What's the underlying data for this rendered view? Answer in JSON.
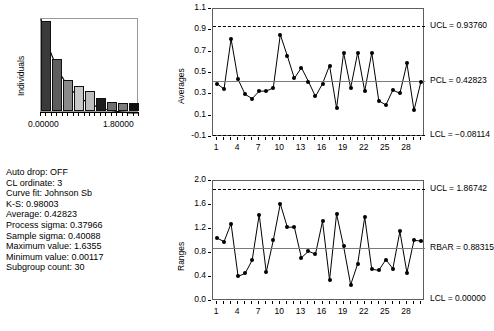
{
  "histogram": {
    "y_axis_title": "Individuals",
    "x_tick_labels": [
      "0.00000",
      "1.80000"
    ],
    "x_min": 0.0,
    "x_max": 1.8,
    "bars": [
      {
        "value": 0.96,
        "shade": "#3a3a3a"
      },
      {
        "value": 0.55,
        "shade": "#5e5e5e"
      },
      {
        "value": 0.33,
        "shade": "#8a8a8a"
      },
      {
        "value": 0.27,
        "shade": "#c8c8c8"
      },
      {
        "value": 0.21,
        "shade": "#bdbdbd"
      },
      {
        "value": 0.14,
        "shade": "#1c1c1c"
      },
      {
        "value": 0.1,
        "shade": "#6f6f6f"
      },
      {
        "value": 0.085,
        "shade": "#7d7d7d"
      },
      {
        "value": 0.09,
        "shade": "#101010"
      }
    ],
    "curve_fit_label": "Johnson Sb"
  },
  "info": {
    "lines": [
      "Auto drop: OFF",
      "CL ordinate: 3",
      "Curve fit: Johnson Sb",
      "K-S: 0.98003",
      "Average: 0.42823",
      "Process sigma: 0.37966",
      "Sample sigma: 0.40088",
      "Maximum value: 1.6355",
      "Minimum value: 0.00117",
      "Subgroup count: 30"
    ],
    "auto_drop": "OFF",
    "cl_ordinate": "3",
    "curve_fit": "Johnson Sb",
    "ks": "0.98003",
    "average": "0.42823",
    "process_sigma": "0.37966",
    "sample_sigma": "0.40088",
    "maximum_value": "1.6355",
    "minimum_value": "0.00117",
    "subgroup_count": "30"
  },
  "chart_data": [
    {
      "type": "line",
      "name": "averages-control-chart",
      "title": "",
      "ylabel": "Averages",
      "xlabel": "",
      "ylim": [
        -0.1,
        1.1
      ],
      "yticks": [
        "1.1",
        "0.9",
        "0.7",
        "0.5",
        "0.3",
        "0.1",
        "-0.1"
      ],
      "ytick_values": [
        1.1,
        0.9,
        0.7,
        0.5,
        0.3,
        0.1,
        -0.1
      ],
      "xticks": [
        "1",
        "4",
        "7",
        "10",
        "13",
        "16",
        "19",
        "22",
        "25",
        "28"
      ],
      "xtick_values": [
        1,
        4,
        7,
        10,
        13,
        16,
        19,
        22,
        25,
        28
      ],
      "xlim": [
        1,
        30
      ],
      "grid": false,
      "legend": "none",
      "x": [
        1,
        2,
        3,
        4,
        5,
        6,
        7,
        8,
        9,
        10,
        11,
        12,
        13,
        14,
        15,
        16,
        17,
        18,
        19,
        20,
        21,
        22,
        23,
        24,
        25,
        26,
        27,
        28,
        29,
        30
      ],
      "values": [
        0.4,
        0.35,
        0.82,
        0.44,
        0.3,
        0.26,
        0.33,
        0.33,
        0.36,
        0.86,
        0.66,
        0.45,
        0.55,
        0.42,
        0.28,
        0.4,
        0.57,
        0.17,
        0.69,
        0.36,
        0.69,
        0.33,
        0.69,
        0.24,
        0.2,
        0.34,
        0.31,
        0.59,
        0.15,
        0.42,
        0.44
      ],
      "annotations": [
        {
          "label": "UCL = 0.93760",
          "value": 0.9376,
          "style": "dashed"
        },
        {
          "label": "PCL = 0.42823",
          "value": 0.42823,
          "style": "solid"
        },
        {
          "label": "LCL = -0.08114",
          "value": -0.08114,
          "style": "dashed"
        }
      ],
      "ucl_label": "UCL = 0.93760",
      "center_label": "PCL = 0.42823",
      "lcl_label": "LCL = −0.08114"
    },
    {
      "type": "line",
      "name": "ranges-control-chart",
      "title": "",
      "ylabel": "Ranges",
      "xlabel": "",
      "ylim": [
        0.0,
        2.0
      ],
      "yticks": [
        "2.0",
        "1.6",
        "1.2",
        "0.8",
        "0.4",
        "0.0"
      ],
      "ytick_values": [
        2.0,
        1.6,
        1.2,
        0.8,
        0.4,
        0.0
      ],
      "xticks": [
        "1",
        "4",
        "7",
        "10",
        "13",
        "16",
        "19",
        "22",
        "25",
        "28"
      ],
      "xtick_values": [
        1,
        4,
        7,
        10,
        13,
        16,
        19,
        22,
        25,
        28
      ],
      "xlim": [
        1,
        30
      ],
      "grid": false,
      "legend": "none",
      "x": [
        1,
        2,
        3,
        4,
        5,
        6,
        7,
        8,
        9,
        10,
        11,
        12,
        13,
        14,
        15,
        16,
        17,
        18,
        19,
        20,
        21,
        22,
        23,
        24,
        25,
        26,
        27,
        28,
        29,
        30
      ],
      "values": [
        1.05,
        0.99,
        1.29,
        0.41,
        0.46,
        0.68,
        1.44,
        0.48,
        1.01,
        1.62,
        1.23,
        1.23,
        0.72,
        0.83,
        0.78,
        1.33,
        0.35,
        1.45,
        0.91,
        0.27,
        0.62,
        1.4,
        0.53,
        0.51,
        0.69,
        0.54,
        1.16,
        0.47,
        1.01,
        1.0
      ],
      "annotations": [
        {
          "label": "UCL = 1.86742",
          "value": 1.86742,
          "style": "dashed"
        },
        {
          "label": "RBAR = 0.88315",
          "value": 0.88315,
          "style": "solid"
        },
        {
          "label": "LCL = 0.00000",
          "value": 0.0,
          "style": "solid-axis"
        }
      ],
      "ucl_label": "UCL = 1.86742",
      "center_label": "RBAR = 0.88315",
      "lcl_label": "LCL = 0.00000"
    }
  ]
}
